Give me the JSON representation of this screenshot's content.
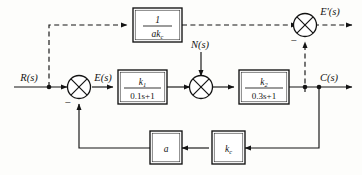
{
  "diagram": {
    "type": "block-diagram",
    "background_color": "#fdfdfb",
    "line_color": "#141414",
    "block_fill": "#ffffff",
    "signals": {
      "input": "R(s)",
      "error": "E(s)",
      "disturbance": "N(s)",
      "output": "C(s)",
      "error_prime": "E'(s)"
    },
    "blocks": [
      {
        "id": "feedforward",
        "numerator": "1",
        "denominator_base": "ak",
        "denominator_sub": "c",
        "label": "1/(ak_c)",
        "style": "fraction"
      },
      {
        "id": "g1",
        "numerator_base": "k",
        "numerator_sub": "1",
        "denominator": "0.1s+1",
        "label": "k_1/(0.1s+1)",
        "style": "fraction"
      },
      {
        "id": "g2",
        "numerator_base": "k",
        "numerator_sub": "2",
        "denominator": "0.3s+1",
        "label": "k_2/(0.3s+1)",
        "style": "fraction"
      },
      {
        "id": "gain-a",
        "label": "a",
        "style": "plain"
      },
      {
        "id": "gain-kc",
        "label_base": "k",
        "label_sub": "c",
        "label": "k_c",
        "style": "plain"
      }
    ],
    "summing_junctions": [
      {
        "id": "sum-error",
        "signs": [
          {
            "symbol": "−",
            "position": "bottom-left"
          }
        ]
      },
      {
        "id": "sum-disturbance",
        "signs": []
      },
      {
        "id": "sum-error-prime",
        "signs": [
          {
            "symbol": "−",
            "position": "bottom-left"
          }
        ]
      }
    ]
  }
}
